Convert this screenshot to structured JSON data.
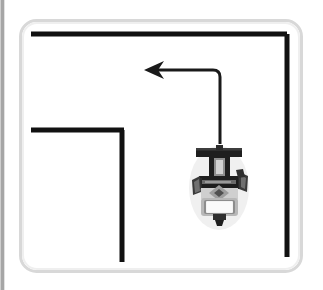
{
  "scene": {
    "title": "Robot navigation maze diagram",
    "canvas": {
      "width": 323,
      "height": 290,
      "background": "#ffffff"
    },
    "edge_rule": {
      "name": "left-edge-gutter-line",
      "color": "#9a9a9a",
      "x": 2,
      "y_start": 0,
      "y_end": 290,
      "thickness": 3
    },
    "frame": {
      "name": "rounded-arena-frame",
      "color": "#d8d8d8",
      "x": 19,
      "y": 19,
      "width": 283,
      "height": 253,
      "radius": 16,
      "thickness": 3
    },
    "walls": {
      "color": "#111111",
      "thickness": 5,
      "segments": [
        {
          "id": "top-wall",
          "label": "top horizontal wall",
          "x1": 31,
          "y1": 34,
          "x2": 287,
          "y2": 34
        },
        {
          "id": "right-wall",
          "label": "right vertical wall",
          "x1": 287,
          "y1": 34,
          "x2": 287,
          "y2": 257
        },
        {
          "id": "inner-wall-horizontal",
          "label": "inner L horizontal wall",
          "x1": 31,
          "y1": 130,
          "x2": 124,
          "y2": 130
        },
        {
          "id": "inner-wall-vertical",
          "label": "inner L vertical wall",
          "x1": 122,
          "y1": 130,
          "x2": 122,
          "y2": 262
        }
      ]
    },
    "path_arrow": {
      "name": "planned-path-arrow",
      "color": "#1a1a1a",
      "thickness": 3,
      "direction": "left",
      "corner_radius": 7,
      "start_x": 220,
      "start_y": 144,
      "corner_x": 220,
      "corner_y": 70,
      "end_x": 158,
      "end_y": 70,
      "arrowhead": {
        "tip_x": 144,
        "tip_y": 70,
        "length": 20,
        "half_width": 9,
        "notch": 6
      }
    },
    "robot": {
      "name": "mobile-robot",
      "heading": "up",
      "center_x": 219,
      "top_y": 144,
      "bottom_y": 224,
      "colors": {
        "dark": "#1e1e1e",
        "mid": "#4a4a4a",
        "gray": "#8a8a8a",
        "light": "#bdbdbd",
        "pale": "#dedede",
        "white": "#f4f4f4"
      },
      "parts": [
        {
          "id": "sensor-bar",
          "label": "top sensor bar"
        },
        {
          "id": "neck",
          "label": "vertical neck mast"
        },
        {
          "id": "chassis",
          "label": "dark chassis body"
        },
        {
          "id": "left-wheel",
          "label": "left wheel"
        },
        {
          "id": "right-wheel",
          "label": "right wheel"
        },
        {
          "id": "hub-diamond",
          "label": "central hub diamond"
        },
        {
          "id": "front-module",
          "label": "front white module"
        },
        {
          "id": "caster-stem",
          "label": "bottom caster stem"
        }
      ]
    }
  }
}
